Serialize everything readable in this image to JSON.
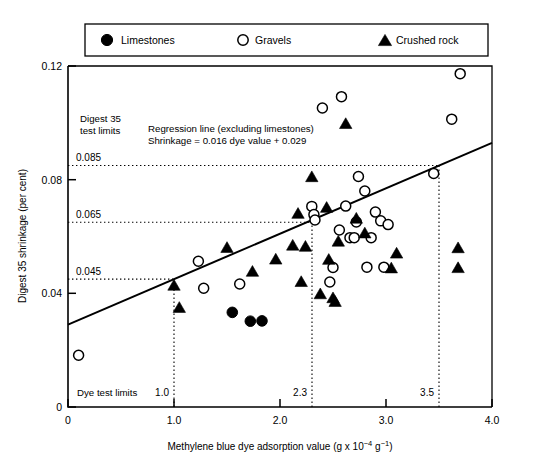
{
  "chart_data": {
    "type": "scatter",
    "title": "",
    "xlabel": "Methylene blue dye adsorption value (g x 10^-4 g^-1)",
    "xlabel_parts": {
      "main": "Methylene blue dye adsorption value (g x 10",
      "exp1": "−4",
      "mid": "g",
      "exp2": "−1",
      "tail": ")"
    },
    "ylabel": "Digest 35 shrinkage (per cent)",
    "xlim": [
      0,
      4.0
    ],
    "ylim": [
      0,
      0.12
    ],
    "xticks": [
      0,
      1.0,
      2.0,
      3.0,
      4.0
    ],
    "xtick_labels": [
      "0",
      "1.0",
      "2.0",
      "3.0",
      "4.0"
    ],
    "yticks": [
      0,
      0.04,
      0.08,
      0.12
    ],
    "ytick_labels": [
      "0",
      "0.04",
      "0.08",
      "0.12"
    ],
    "grid": false,
    "legend_position": "above-plot",
    "legend": [
      {
        "key": "limestones",
        "label": "Limestones",
        "marker": "filled-circle"
      },
      {
        "key": "gravels",
        "label": "Gravels",
        "marker": "open-circle"
      },
      {
        "key": "crushed_rock",
        "label": "Crushed  rock",
        "marker": "filled-triangle"
      }
    ],
    "annotations": [
      {
        "name": "digest-limits-title",
        "lines": [
          "Digest 35",
          "test limits"
        ],
        "x": 0.12,
        "y": 0.1035
      },
      {
        "name": "regression-annotation",
        "lines": [
          "Regression line (excluding limestones)",
          "Shrinkage = 0.016 dye value + 0.029"
        ],
        "x": 0.72,
        "y": 0.1005
      },
      {
        "name": "dye-limits-title",
        "lines": [
          "Dye test limits"
        ],
        "x": 0.1,
        "y": 0.0077
      }
    ],
    "regression_line": {
      "label": "Regression line (excluding limestones)",
      "equation": "Shrinkage = 0.016 dye value + 0.029",
      "slope": 0.016,
      "intercept": 0.029,
      "x_start": 0.0,
      "x_end": 4.0
    },
    "horizontal_limits": [
      {
        "value": 0.085,
        "label": "0.085",
        "x_start": 0.0,
        "x_end": 3.5
      },
      {
        "value": 0.065,
        "label": "0.065",
        "x_start": 0.0,
        "x_end": 2.3
      },
      {
        "value": 0.045,
        "label": "0.045",
        "x_start": 0.0,
        "x_end": 1.0
      }
    ],
    "vertical_limits": [
      {
        "value": 1.0,
        "label": "1.0",
        "y_start": 0.0,
        "y_end": 0.045
      },
      {
        "value": 2.3,
        "label": "2.3",
        "y_start": 0.0,
        "y_end": 0.065
      },
      {
        "value": 3.5,
        "label": "3.5",
        "y_start": 0.0,
        "y_end": 0.085
      }
    ],
    "series": [
      {
        "name": "Limestones",
        "marker": "filled-circle",
        "points": [
          [
            1.55,
            0.0333
          ],
          [
            1.72,
            0.0302
          ],
          [
            1.83,
            0.0303
          ]
        ]
      },
      {
        "name": "Gravels",
        "marker": "open-circle",
        "points": [
          [
            0.1,
            0.0182
          ],
          [
            1.23,
            0.0513
          ],
          [
            1.28,
            0.0418
          ],
          [
            1.62,
            0.0433
          ],
          [
            2.3,
            0.0706
          ],
          [
            2.32,
            0.0677
          ],
          [
            2.33,
            0.0658
          ],
          [
            2.4,
            0.1052
          ],
          [
            2.47,
            0.044
          ],
          [
            2.5,
            0.0491
          ],
          [
            2.56,
            0.0623
          ],
          [
            2.58,
            0.1092
          ],
          [
            2.62,
            0.0707
          ],
          [
            2.66,
            0.0596
          ],
          [
            2.7,
            0.0596
          ],
          [
            2.72,
            0.0651
          ],
          [
            2.74,
            0.0811
          ],
          [
            2.8,
            0.076
          ],
          [
            2.82,
            0.0492
          ],
          [
            2.86,
            0.0596
          ],
          [
            2.9,
            0.0686
          ],
          [
            2.95,
            0.0655
          ],
          [
            2.98,
            0.0492
          ],
          [
            3.02,
            0.0642
          ],
          [
            3.45,
            0.0822
          ],
          [
            3.62,
            0.1013
          ],
          [
            3.7,
            0.1173
          ]
        ]
      },
      {
        "name": "Crushed rock",
        "marker": "filled-triangle",
        "points": [
          [
            1.0,
            0.0428
          ],
          [
            1.05,
            0.035
          ],
          [
            1.5,
            0.0561
          ],
          [
            1.74,
            0.0477
          ],
          [
            1.96,
            0.052
          ],
          [
            2.12,
            0.0569
          ],
          [
            2.17,
            0.0681
          ],
          [
            2.2,
            0.0441
          ],
          [
            2.24,
            0.0565
          ],
          [
            2.3,
            0.081
          ],
          [
            2.38,
            0.0398
          ],
          [
            2.44,
            0.0702
          ],
          [
            2.46,
            0.0519
          ],
          [
            2.5,
            0.0384
          ],
          [
            2.52,
            0.0371
          ],
          [
            2.55,
            0.0583
          ],
          [
            2.62,
            0.0997
          ],
          [
            2.72,
            0.0664
          ],
          [
            2.8,
            0.0612
          ],
          [
            3.05,
            0.0489
          ],
          [
            3.1,
            0.0541
          ],
          [
            3.68,
            0.056
          ],
          [
            3.68,
            0.049
          ]
        ]
      }
    ]
  }
}
